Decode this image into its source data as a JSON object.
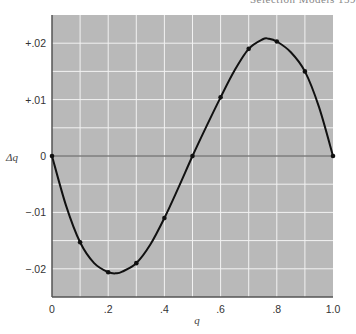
{
  "header": {
    "running_head": "Selection Models   159"
  },
  "chart_data": {
    "type": "line",
    "title": "",
    "xlabel": "q",
    "ylabel": "Δq",
    "xlim": [
      0,
      1.0
    ],
    "ylim": [
      -0.025,
      0.025
    ],
    "grid": true,
    "background": "#b9b9b9",
    "grid_color": "#f2f2f2",
    "line_color": "#111111",
    "x_ticks": [
      0,
      0.2,
      0.4,
      0.6,
      0.8,
      1.0
    ],
    "x_tick_labels": [
      "0",
      ".2",
      ".4",
      ".6",
      ".8",
      "1.0"
    ],
    "y_ticks": [
      0.02,
      0.01,
      0,
      -0.01,
      -0.02
    ],
    "y_tick_labels": [
      "+.02",
      "+.01",
      "0",
      "−.01",
      "−.02"
    ],
    "x_grid_step": 0.1,
    "y_grid_step": 0.005,
    "series": [
      {
        "name": "Δq",
        "points": [
          [
            0.0,
            0.0
          ],
          [
            0.1,
            -0.0153
          ],
          [
            0.2,
            -0.0206
          ],
          [
            0.3,
            -0.019
          ],
          [
            0.4,
            -0.011
          ],
          [
            0.5,
            0.0
          ],
          [
            0.6,
            0.0104
          ],
          [
            0.7,
            0.019
          ],
          [
            0.8,
            0.0203
          ],
          [
            0.9,
            0.015
          ],
          [
            1.0,
            0.0
          ]
        ],
        "curve": [
          [
            0.0,
            0.0
          ],
          [
            0.05,
            -0.0088
          ],
          [
            0.1,
            -0.0153
          ],
          [
            0.15,
            -0.019
          ],
          [
            0.2,
            -0.0206
          ],
          [
            0.23,
            -0.0208
          ],
          [
            0.25,
            -0.0205
          ],
          [
            0.3,
            -0.019
          ],
          [
            0.35,
            -0.0157
          ],
          [
            0.4,
            -0.011
          ],
          [
            0.45,
            -0.0056
          ],
          [
            0.5,
            0.0
          ],
          [
            0.55,
            0.0053
          ],
          [
            0.6,
            0.0104
          ],
          [
            0.65,
            0.0152
          ],
          [
            0.7,
            0.019
          ],
          [
            0.75,
            0.0207
          ],
          [
            0.77,
            0.0208
          ],
          [
            0.8,
            0.0203
          ],
          [
            0.85,
            0.0184
          ],
          [
            0.9,
            0.015
          ],
          [
            0.95,
            0.0087
          ],
          [
            1.0,
            0.0
          ]
        ]
      }
    ]
  }
}
